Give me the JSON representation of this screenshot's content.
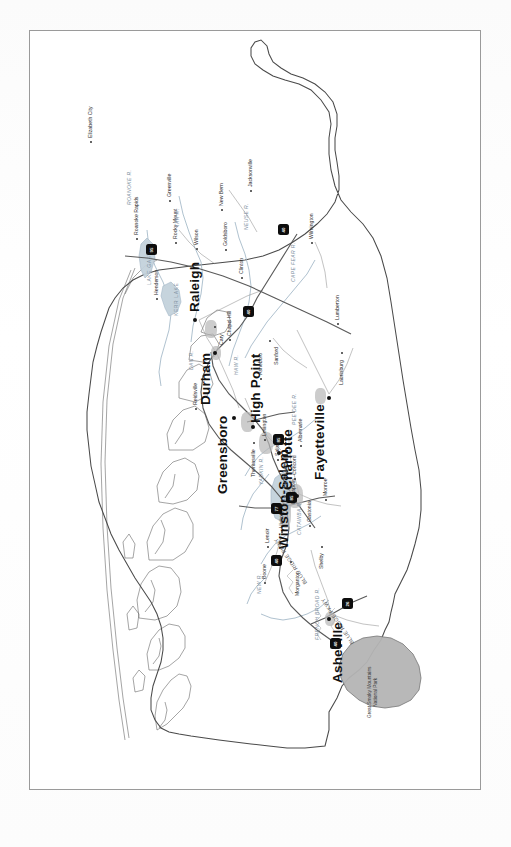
{
  "document": {
    "kind": "printed-map-page",
    "orientation_note": "map rotated 90 degrees counter-clockwise on the page",
    "page_background": "#ffffff",
    "border_color": "#9a9a9a"
  },
  "map": {
    "state": "North Carolina",
    "style": {
      "land_fill": "#ffffff",
      "outline_color": "#4a4a4a",
      "road_color": "#7a7a7a",
      "interstate_color": "#555555",
      "water_color": "#9db3c4",
      "park_fill": "#b5b5b5",
      "park_outline": "#6f6f6f",
      "urban_fill": "#b9b9b9",
      "marker_color": "#0d0d0d"
    },
    "major_cities": [
      {
        "name": "Raleigh",
        "x": 470,
        "y": 166
      },
      {
        "name": "Durham",
        "x": 437,
        "y": 186
      },
      {
        "name": "Greensboro",
        "x": 372,
        "y": 205
      },
      {
        "name": "High Point",
        "x": 363,
        "y": 224
      },
      {
        "name": "Winston-Salem",
        "x": 337,
        "y": 250
      },
      {
        "name": "Charlotte",
        "x": 294,
        "y": 268
      },
      {
        "name": "Fayetteville",
        "x": 392,
        "y": 300
      },
      {
        "name": "Asheville",
        "x": 171,
        "y": 300
      }
    ],
    "minor_cities": [
      {
        "name": "Elizabeth City",
        "x": 648,
        "y": 62
      },
      {
        "name": "Roanoke Rapids",
        "x": 551,
        "y": 108
      },
      {
        "name": "Rocky Mount",
        "x": 547,
        "y": 147
      },
      {
        "name": "Wilson",
        "x": 541,
        "y": 168
      },
      {
        "name": "Greenville",
        "x": 589,
        "y": 141
      },
      {
        "name": "Goldsboro",
        "x": 540,
        "y": 197
      },
      {
        "name": "Clinton",
        "x": 512,
        "y": 213
      },
      {
        "name": "New Bern",
        "x": 580,
        "y": 193
      },
      {
        "name": "Jacksonville",
        "x": 599,
        "y": 222
      },
      {
        "name": "Wilmington",
        "x": 547,
        "y": 283
      },
      {
        "name": "Henderson",
        "x": 491,
        "y": 128
      },
      {
        "name": "Chapel Hill",
        "x": 450,
        "y": 201
      },
      {
        "name": "Cary",
        "x": 463,
        "y": 186
      },
      {
        "name": "Reidsville",
        "x": 381,
        "y": 167
      },
      {
        "name": "Asheboro",
        "x": 411,
        "y": 232
      },
      {
        "name": "Sanford",
        "x": 449,
        "y": 241
      },
      {
        "name": "Lumberton",
        "x": 466,
        "y": 309
      },
      {
        "name": "Laurinburg",
        "x": 437,
        "y": 313
      },
      {
        "name": "Lexington",
        "x": 350,
        "y": 236
      },
      {
        "name": "Thomasville",
        "x": 347,
        "y": 225
      },
      {
        "name": "Salisbury",
        "x": 330,
        "y": 249
      },
      {
        "name": "Kannapolis",
        "x": 318,
        "y": 258
      },
      {
        "name": "Concord",
        "x": 311,
        "y": 266
      },
      {
        "name": "Albemarle",
        "x": 344,
        "y": 272
      },
      {
        "name": "Monroe",
        "x": 290,
        "y": 297
      },
      {
        "name": "Gastonia",
        "x": 264,
        "y": 281
      },
      {
        "name": "Shelby",
        "x": 243,
        "y": 293
      },
      {
        "name": "Hickory",
        "x": 258,
        "y": 253
      },
      {
        "name": "Morganton",
        "x": 228,
        "y": 262
      },
      {
        "name": "Lenoir",
        "x": 243,
        "y": 239
      },
      {
        "name": "Boone",
        "x": 207,
        "y": 236
      }
    ],
    "water_labels": [
      {
        "name": "LAKE GASTON",
        "x": 505,
        "y": 118
      },
      {
        "name": "KERR LAKE",
        "x": 474,
        "y": 145
      },
      {
        "name": "LAKE NORMAN",
        "x": 285,
        "y": 254
      },
      {
        "name": "ROANOKE R.",
        "x": 585,
        "y": 98
      },
      {
        "name": "TAR R.",
        "x": 563,
        "y": 146
      },
      {
        "name": "NEUSE R.",
        "x": 560,
        "y": 215
      },
      {
        "name": "CAPE FEAR R.",
        "x": 508,
        "y": 262
      },
      {
        "name": "PEE DEE R.",
        "x": 365,
        "y": 263
      },
      {
        "name": "YADKIN R.",
        "x": 305,
        "y": 230
      },
      {
        "name": "CATAWBA R.",
        "x": 255,
        "y": 268
      },
      {
        "name": "DAN R.",
        "x": 420,
        "y": 160
      },
      {
        "name": "HAW R.",
        "x": 415,
        "y": 205
      },
      {
        "name": "FRENCH BROAD R.",
        "x": 160,
        "y": 286
      },
      {
        "name": "NEW R.",
        "x": 196,
        "y": 228
      }
    ],
    "park": {
      "name_line1": "Great Smoky Mountains",
      "name_line2": "National Park",
      "label_x": 72,
      "label_y": 345
    },
    "parkway_labels": [
      {
        "name": "BLUE RIDGE PKWY",
        "x": 205,
        "y": 275
      },
      {
        "name": "BLUE RIDGE PKWY",
        "x": 145,
        "y": 322
      }
    ],
    "interstate_shields": [
      {
        "number": "95",
        "x": 540,
        "y": 122
      },
      {
        "number": "40",
        "x": 478,
        "y": 219
      },
      {
        "number": "40",
        "x": 560,
        "y": 254
      },
      {
        "number": "85",
        "x": 350,
        "y": 249
      },
      {
        "number": "85",
        "x": 292,
        "y": 262
      },
      {
        "number": "77",
        "x": 281,
        "y": 247
      },
      {
        "number": "40",
        "x": 229,
        "y": 247
      },
      {
        "number": "26",
        "x": 186,
        "y": 318
      },
      {
        "number": "40",
        "x": 146,
        "y": 306
      }
    ]
  }
}
